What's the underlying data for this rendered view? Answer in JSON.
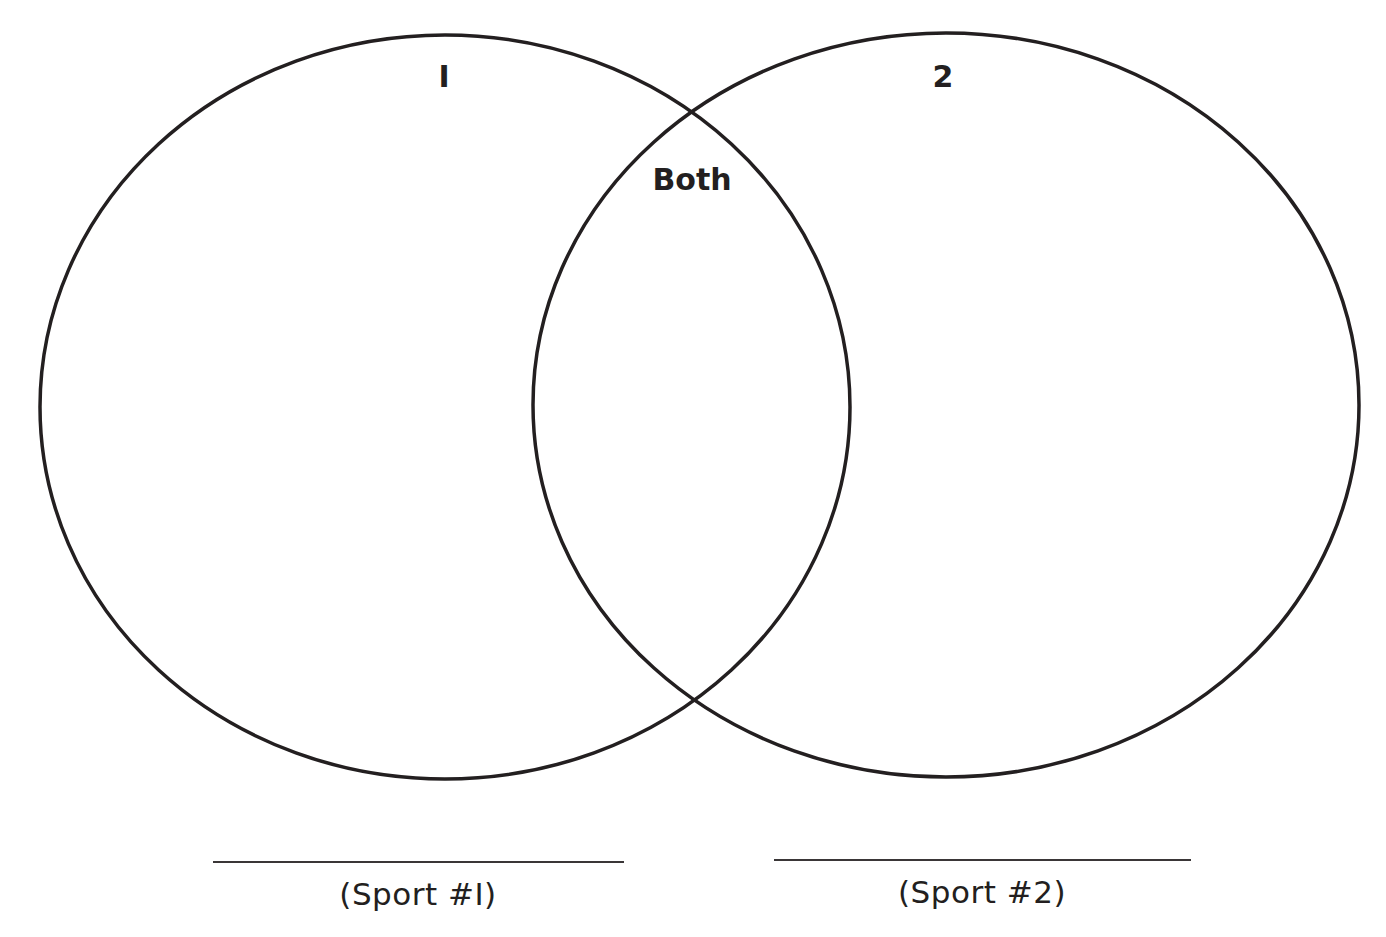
{
  "diagram": {
    "type": "venn",
    "stroke_color": "#231f20",
    "circles": [
      {
        "id": "1",
        "label": "I",
        "cx": 445,
        "cy": 407,
        "rx": 405,
        "ry": 372
      },
      {
        "id": "2",
        "label": "2",
        "cx": 946,
        "cy": 405,
        "rx": 413,
        "ry": 372
      }
    ],
    "overlap_label": "Both",
    "answer_lines": [
      {
        "caption": "(Sport #I)"
      },
      {
        "caption": "(Sport #2)"
      }
    ]
  }
}
